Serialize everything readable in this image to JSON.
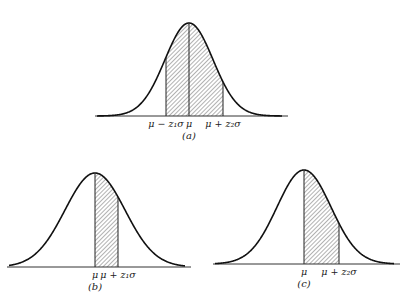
{
  "figure": {
    "panels": [
      {
        "id": "a",
        "caption": "(a)",
        "mean_px": 189,
        "baseline_px": 116,
        "peak_px": 23,
        "sigma_px": 24,
        "axis_from": 95,
        "axis_to": 288,
        "shade_from": 166,
        "shade_to": 223,
        "labels": [
          {
            "text": "μ − z₁σ",
            "x": 166
          },
          {
            "text": "μ",
            "x": 189
          },
          {
            "text": "μ + z₂σ",
            "x": 223
          }
        ]
      },
      {
        "id": "b",
        "caption": "(b)",
        "mean_px": 95,
        "baseline_px": 267,
        "peak_px": 173,
        "sigma_px": 30,
        "axis_from": 7,
        "axis_to": 191,
        "shade_from": 95,
        "shade_to": 118,
        "labels": [
          {
            "text": "μ",
            "x": 95
          },
          {
            "text": "μ + z₁σ",
            "x": 118
          }
        ]
      },
      {
        "id": "c",
        "caption": "(c)",
        "mean_px": 304,
        "baseline_px": 264,
        "peak_px": 170,
        "sigma_px": 27,
        "axis_from": 213,
        "axis_to": 400,
        "shade_from": 304,
        "shade_to": 339,
        "labels": [
          {
            "text": "μ",
            "x": 304
          },
          {
            "text": "μ + z₂σ",
            "x": 339
          }
        ]
      }
    ]
  }
}
